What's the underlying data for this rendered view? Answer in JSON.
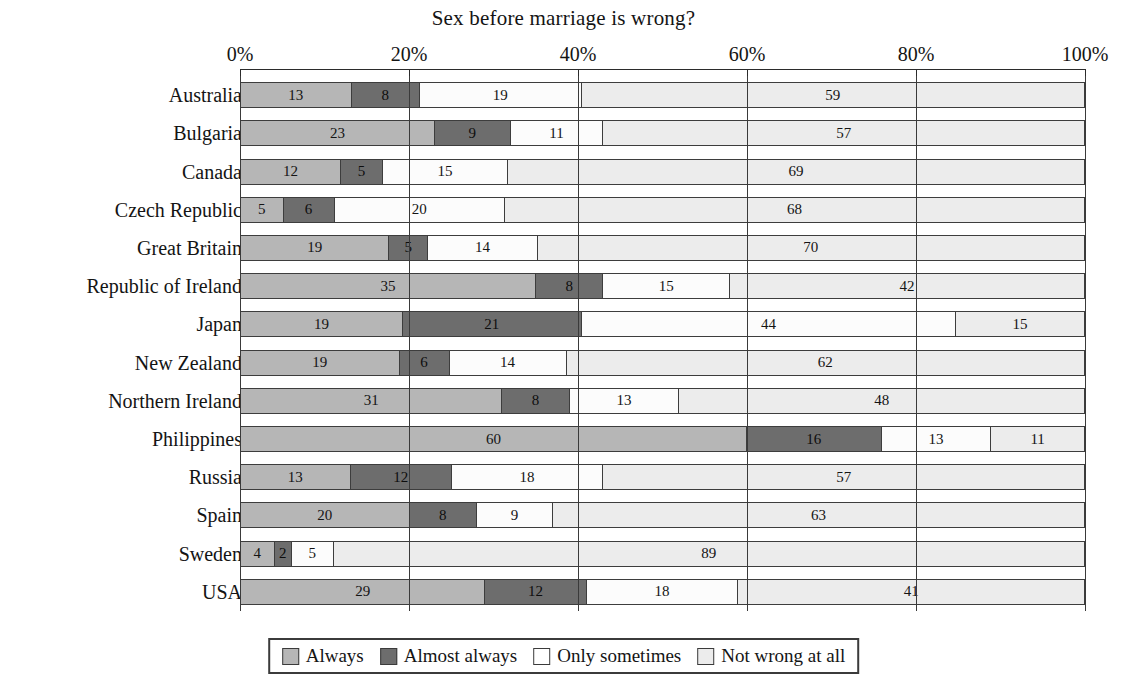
{
  "chart_data": {
    "type": "bar",
    "orientation": "horizontal",
    "stacked": true,
    "normalized_percent": true,
    "title": "Sex before marriage is wrong?",
    "xlabel": "",
    "ylabel": "",
    "xlim": [
      0,
      100
    ],
    "xticks": [
      "0%",
      "20%",
      "40%",
      "60%",
      "80%",
      "100%"
    ],
    "xtick_values": [
      0,
      20,
      40,
      60,
      80,
      100
    ],
    "grid": true,
    "legend_position": "bottom",
    "legend": [
      "Always",
      "Almost always",
      "Only sometimes",
      "Not wrong at all"
    ],
    "colors": [
      "#b6b6b6",
      "#6d6d6d",
      "#fcfcfc",
      "#ececec"
    ],
    "categories": [
      "Australia",
      "Bulgaria",
      "Canada",
      "Czech Republic",
      "Great Britain",
      "Republic of Ireland",
      "Japan",
      "New Zealand",
      "Northern Ireland",
      "Philippines",
      "Russia",
      "Spain",
      "Sweden",
      "USA"
    ],
    "series": [
      {
        "name": "Always",
        "values": [
          13,
          23,
          12,
          5,
          19,
          35,
          19,
          19,
          31,
          60,
          13,
          20,
          4,
          29
        ]
      },
      {
        "name": "Almost always",
        "values": [
          8,
          9,
          5,
          6,
          5,
          8,
          21,
          6,
          8,
          16,
          12,
          8,
          2,
          12
        ]
      },
      {
        "name": "Only sometimes",
        "values": [
          19,
          11,
          15,
          20,
          14,
          15,
          44,
          14,
          13,
          13,
          18,
          9,
          5,
          18
        ]
      },
      {
        "name": "Not wrong at all",
        "values": [
          59,
          57,
          69,
          68,
          70,
          42,
          15,
          62,
          48,
          11,
          57,
          63,
          89,
          41
        ]
      }
    ]
  }
}
